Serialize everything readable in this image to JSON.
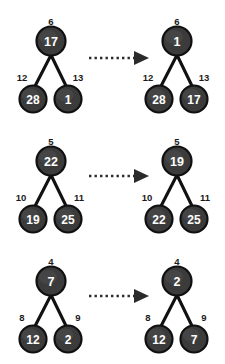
{
  "figure": {
    "title": "",
    "background_color": "#ffffff",
    "node_fill_color": "#3b3b3b",
    "node_stroke_color": "#101010",
    "node_text_color": "#ffffff",
    "index_label_color": "#1a1a1a",
    "edge_color": "#111111",
    "arrow_color": "#2b2b2b",
    "arrow_style": "dotted-right-arrow"
  },
  "rows": [
    {
      "id": "row-1",
      "before": {
        "root": {
          "value": "17",
          "index": "6"
        },
        "left": {
          "value": "28",
          "index": "12"
        },
        "right": {
          "value": "1",
          "index": "13"
        }
      },
      "after": {
        "root": {
          "value": "1",
          "index": "6"
        },
        "left": {
          "value": "28",
          "index": "12"
        },
        "right": {
          "value": "17",
          "index": "13"
        }
      }
    },
    {
      "id": "row-2",
      "before": {
        "root": {
          "value": "22",
          "index": "5"
        },
        "left": {
          "value": "19",
          "index": "10"
        },
        "right": {
          "value": "25",
          "index": "11"
        }
      },
      "after": {
        "root": {
          "value": "19",
          "index": "5"
        },
        "left": {
          "value": "22",
          "index": "10"
        },
        "right": {
          "value": "25",
          "index": "11"
        }
      }
    },
    {
      "id": "row-3",
      "before": {
        "root": {
          "value": "7",
          "index": "4"
        },
        "left": {
          "value": "12",
          "index": "8"
        },
        "right": {
          "value": "2",
          "index": "9"
        }
      },
      "after": {
        "root": {
          "value": "2",
          "index": "4"
        },
        "left": {
          "value": "12",
          "index": "8"
        },
        "right": {
          "value": "7",
          "index": "9"
        }
      }
    }
  ]
}
